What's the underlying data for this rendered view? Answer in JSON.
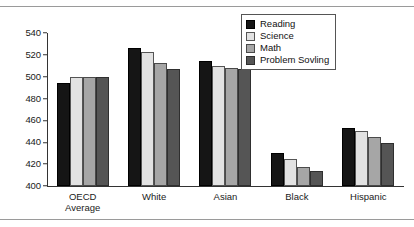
{
  "chart_data": {
    "type": "bar",
    "title": "",
    "subtitle": "",
    "xlabel": "",
    "ylabel": "",
    "ylim": [
      400,
      540
    ],
    "yticks": [
      400,
      420,
      440,
      460,
      480,
      500,
      520,
      540
    ],
    "grid": false,
    "legend_position": "top-right",
    "categories": [
      "OECD\nAverage",
      "White",
      "Asian",
      "Black",
      "Hispanic"
    ],
    "category_labels": [
      [
        "OECD",
        "Average"
      ],
      [
        "White"
      ],
      [
        "Asian"
      ],
      [
        "Black"
      ],
      [
        "Hispanic"
      ]
    ],
    "series": [
      {
        "name": "Reading",
        "color": "#151515",
        "values": [
          494,
          526,
          514,
          430,
          453
        ]
      },
      {
        "name": "Science",
        "color": "#e2e2e2",
        "values": [
          500,
          523,
          510,
          425,
          450
        ]
      },
      {
        "name": "Math",
        "color": "#a6a6a6",
        "values": [
          500,
          513,
          508,
          417,
          445
        ]
      },
      {
        "name": "Problem Sovling",
        "color": "#555555",
        "values": [
          500,
          507,
          507,
          414,
          439
        ]
      }
    ]
  },
  "legend": {
    "items": [
      {
        "label": "Reading"
      },
      {
        "label": "Science"
      },
      {
        "label": "Math"
      },
      {
        "label": "Problem Sovling"
      }
    ]
  }
}
